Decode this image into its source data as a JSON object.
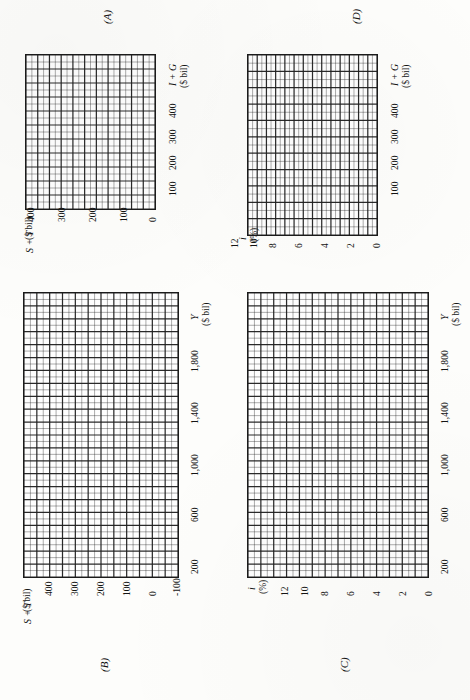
{
  "page": {
    "orientation": "rotated-90-ccw",
    "background_color": "#fdfdfb",
    "ink_color": "#1b1b1b"
  },
  "chart_data": [
    {
      "id": "A",
      "type": "line",
      "title": "(A)",
      "xlabel": "I + G",
      "xunit": "($ bil)",
      "ylabel": "S + T",
      "yunit": "($ bil)",
      "xticks": [
        "100",
        "200",
        "300",
        "400"
      ],
      "yticks": [
        "0",
        "100",
        "200",
        "300",
        "400"
      ],
      "xlim": [
        0,
        550
      ],
      "ylim": [
        0,
        550
      ],
      "x_tick_step": 100,
      "y_tick_step": 100,
      "grid": true,
      "grid_cols": 11,
      "grid_rows": 11,
      "minor_per_major": 2,
      "series": [],
      "values": [],
      "legend": null,
      "annotations": []
    },
    {
      "id": "B",
      "type": "line",
      "title": "(B)",
      "xlabel": "Y",
      "xunit": "($ bil)",
      "ylabel": "S + T",
      "yunit": "($ bil)",
      "xticks": [
        "200",
        "600",
        "1,000",
        "1,400",
        "1,800"
      ],
      "yticks": [
        "-100",
        "0",
        "100",
        "200",
        "300",
        "400"
      ],
      "xlim": [
        0,
        2200
      ],
      "ylim": [
        -100,
        500
      ],
      "x_tick_step": 400,
      "y_tick_step": 100,
      "grid": true,
      "grid_cols": 22,
      "grid_rows": 12,
      "minor_per_major": 2,
      "series": [],
      "values": [],
      "legend": null,
      "annotations": []
    },
    {
      "id": "C",
      "type": "line",
      "title": "(C)",
      "xlabel": "Y",
      "xunit": "($ bil)",
      "ylabel": "i",
      "yunit": "(%)",
      "xticks": [
        "200",
        "600",
        "1,000",
        "1,400",
        "1,800"
      ],
      "yticks": [
        "0",
        "2",
        "4",
        "6",
        "8",
        "10",
        "12"
      ],
      "xlim": [
        0,
        2200
      ],
      "ylim": [
        0,
        14
      ],
      "x_tick_step": 400,
      "y_tick_step": 2,
      "grid": true,
      "grid_cols": 22,
      "grid_rows": 14,
      "minor_per_major": 2,
      "series": [],
      "values": [],
      "legend": null,
      "annotations": []
    },
    {
      "id": "D",
      "type": "line",
      "title": "(D)",
      "xlabel": "I + G",
      "xunit": "($ bil)",
      "ylabel": "i",
      "yunit": "(%)",
      "xticks": [
        "100",
        "200",
        "300",
        "400"
      ],
      "yticks": [
        "0",
        "2",
        "4",
        "6",
        "8",
        "10",
        "12"
      ],
      "xlim": [
        0,
        550
      ],
      "ylim": [
        0,
        14
      ],
      "x_tick_step": 100,
      "y_tick_step": 2,
      "grid": true,
      "grid_cols": 11,
      "grid_rows": 14,
      "minor_per_major": 2,
      "series": [],
      "values": [],
      "legend": null,
      "annotations": []
    }
  ],
  "panels": {
    "A": {
      "label": "(A)",
      "x_axis_title": "I + G",
      "x_axis_unit": "($ bil)",
      "y_axis_title": "S + T",
      "y_axis_unit": "($ bil)",
      "x_ticks": [
        "100",
        "200",
        "300",
        "400"
      ],
      "y_ticks": [
        "0",
        "100",
        "200",
        "300",
        "400"
      ]
    },
    "B": {
      "label": "(B)",
      "x_axis_title": "Y",
      "x_axis_unit": "($ bil)",
      "y_axis_title": "S + T",
      "y_axis_unit": "($ bil)",
      "x_ticks": [
        "200",
        "600",
        "1,000",
        "1,400",
        "1,800"
      ],
      "y_ticks": [
        "-100",
        "0",
        "100",
        "200",
        "300",
        "400"
      ]
    },
    "C": {
      "label": "(C)",
      "x_axis_title": "Y",
      "x_axis_unit": "($ bil)",
      "y_axis_title": "i",
      "y_axis_unit": "(%)",
      "x_ticks": [
        "200",
        "600",
        "1,000",
        "1,400",
        "1,800"
      ],
      "y_ticks": [
        "0",
        "2",
        "4",
        "6",
        "8",
        "10",
        "12"
      ]
    },
    "D": {
      "label": "(D)",
      "x_axis_title": "I + G",
      "x_axis_unit": "($ bil)",
      "y_axis_title": "i",
      "y_axis_unit": "(%)",
      "x_ticks": [
        "100",
        "200",
        "300",
        "400"
      ],
      "y_ticks": [
        "0",
        "2",
        "4",
        "6",
        "8",
        "10",
        "12"
      ]
    }
  }
}
